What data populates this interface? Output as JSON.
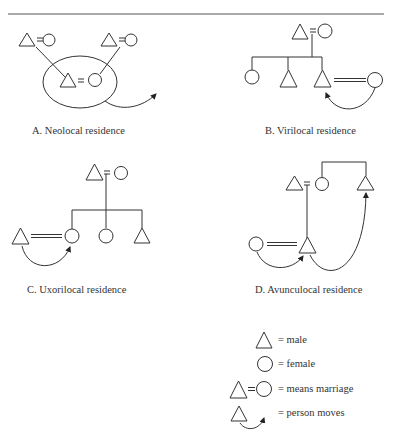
{
  "figure": {
    "panels": [
      {
        "id": "A",
        "caption": "A. Neolocal residence"
      },
      {
        "id": "B",
        "caption": "B. Virilocal residence"
      },
      {
        "id": "C",
        "caption": "C. Uxorilocal residence"
      },
      {
        "id": "D",
        "caption": "D. Avunculocal residence"
      }
    ],
    "legend": [
      {
        "symbol": "triangle",
        "text": "= male"
      },
      {
        "symbol": "circle",
        "text": "= female"
      },
      {
        "symbol": "triangle-equals-circle",
        "text": "= means marriage"
      },
      {
        "symbol": "triangle-with-arrow",
        "text": "= person moves"
      }
    ],
    "colors": {
      "stroke": "#333333",
      "background": "#ffffff"
    }
  }
}
